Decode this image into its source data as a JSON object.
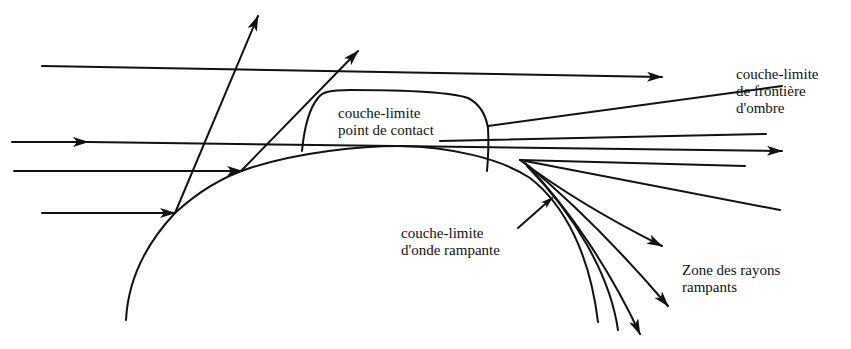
{
  "diagram": {
    "type": "ray-optics boundary-layer diagram (diffraction by a convex body)",
    "colors": {
      "ink": "#111111",
      "background": "#ffffff"
    },
    "labels": {
      "contact_point_layer": {
        "line1": "couche-limite",
        "line2": "point de contact"
      },
      "shadow_boundary_layer": {
        "line1": "couche-limite",
        "line2": "de frontière",
        "line3": "d'ombre"
      },
      "creeping_wave_layer": {
        "line1": "couche-limite",
        "line2": "d'onde rampante"
      },
      "creeping_rays_zone": {
        "line1": "Zone des rayons",
        "line2": "rampants"
      }
    },
    "elements": [
      "convex-body-surface",
      "incident-rays",
      "reflected-rays",
      "shadow-boundary-rays",
      "creeping-rays",
      "contact-point-boundary-layer-region"
    ]
  }
}
